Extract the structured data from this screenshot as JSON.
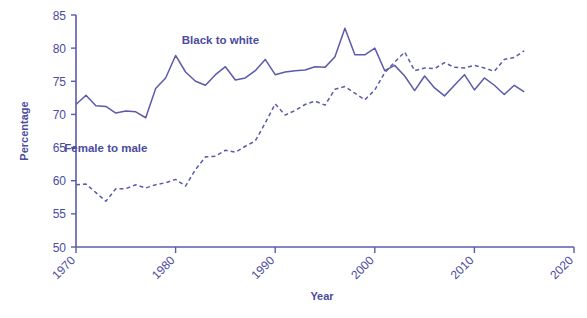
{
  "chart_data": {
    "type": "line",
    "title": "",
    "xlabel": "Year",
    "ylabel": "Percentage",
    "xlim": [
      1970,
      2020
    ],
    "ylim": [
      50,
      85
    ],
    "xticks": [
      1970,
      1980,
      1990,
      2000,
      2010,
      2020
    ],
    "yticks": [
      50,
      55,
      60,
      65,
      70,
      75,
      80,
      85
    ],
    "grid": false,
    "legend": "inline-annotations",
    "accent_color": "#5b5bab",
    "series": [
      {
        "name": "Black to white",
        "style": "solid",
        "label_x": 1984.5,
        "label_y": 80.6,
        "x": [
          1970,
          1971,
          1972,
          1973,
          1974,
          1975,
          1976,
          1977,
          1978,
          1979,
          1980,
          1981,
          1982,
          1983,
          1984,
          1985,
          1986,
          1987,
          1988,
          1989,
          1990,
          1991,
          1992,
          1993,
          1994,
          1995,
          1996,
          1997,
          1998,
          1999,
          2000,
          2001,
          2002,
          2003,
          2004,
          2005,
          2006,
          2007,
          2008,
          2009,
          2010,
          2011,
          2012,
          2013,
          2014,
          2015
        ],
        "values": [
          71.5,
          72.9,
          71.3,
          71.2,
          70.2,
          70.5,
          70.4,
          69.5,
          73.9,
          75.5,
          78.9,
          76.4,
          75.0,
          74.4,
          76.0,
          77.2,
          75.2,
          75.5,
          76.6,
          78.3,
          76.0,
          76.4,
          76.6,
          76.7,
          77.2,
          77.1,
          78.7,
          83.0,
          79.0,
          79.0,
          80.0,
          76.6,
          77.4,
          75.8,
          73.6,
          75.8,
          74.0,
          72.8,
          74.4,
          76.0,
          73.7,
          75.5,
          74.4,
          73.0,
          74.4,
          73.4
        ]
      },
      {
        "name": "Female to male",
        "style": "dashed",
        "label_x": 1973.0,
        "label_y": 64.4,
        "x": [
          1970,
          1971,
          1972,
          1973,
          1974,
          1975,
          1976,
          1977,
          1978,
          1979,
          1980,
          1981,
          1982,
          1983,
          1984,
          1985,
          1986,
          1987,
          1988,
          1989,
          1990,
          1991,
          1992,
          1993,
          1994,
          1995,
          1996,
          1997,
          1998,
          1999,
          2000,
          2001,
          2002,
          2003,
          2004,
          2005,
          2006,
          2007,
          2008,
          2009,
          2010,
          2011,
          2012,
          2013,
          2014,
          2015
        ],
        "values": [
          59.4,
          59.5,
          58.2,
          56.9,
          58.8,
          58.8,
          59.4,
          58.9,
          59.4,
          59.7,
          60.2,
          59.2,
          61.7,
          63.6,
          63.7,
          64.6,
          64.3,
          65.2,
          66.0,
          68.7,
          71.6,
          69.9,
          70.6,
          71.5,
          72.0,
          71.4,
          73.8,
          74.2,
          73.2,
          72.2,
          73.7,
          76.3,
          77.9,
          79.4,
          76.6,
          77.0,
          76.9,
          77.8,
          77.1,
          77.0,
          77.4,
          77.0,
          76.5,
          78.3,
          78.6,
          79.6
        ]
      }
    ]
  },
  "labels": {
    "y_axis_title": "Percentage",
    "x_axis_title": "Year",
    "series_black_to_white": "Black to white",
    "series_female_to_male": "Female to male"
  }
}
